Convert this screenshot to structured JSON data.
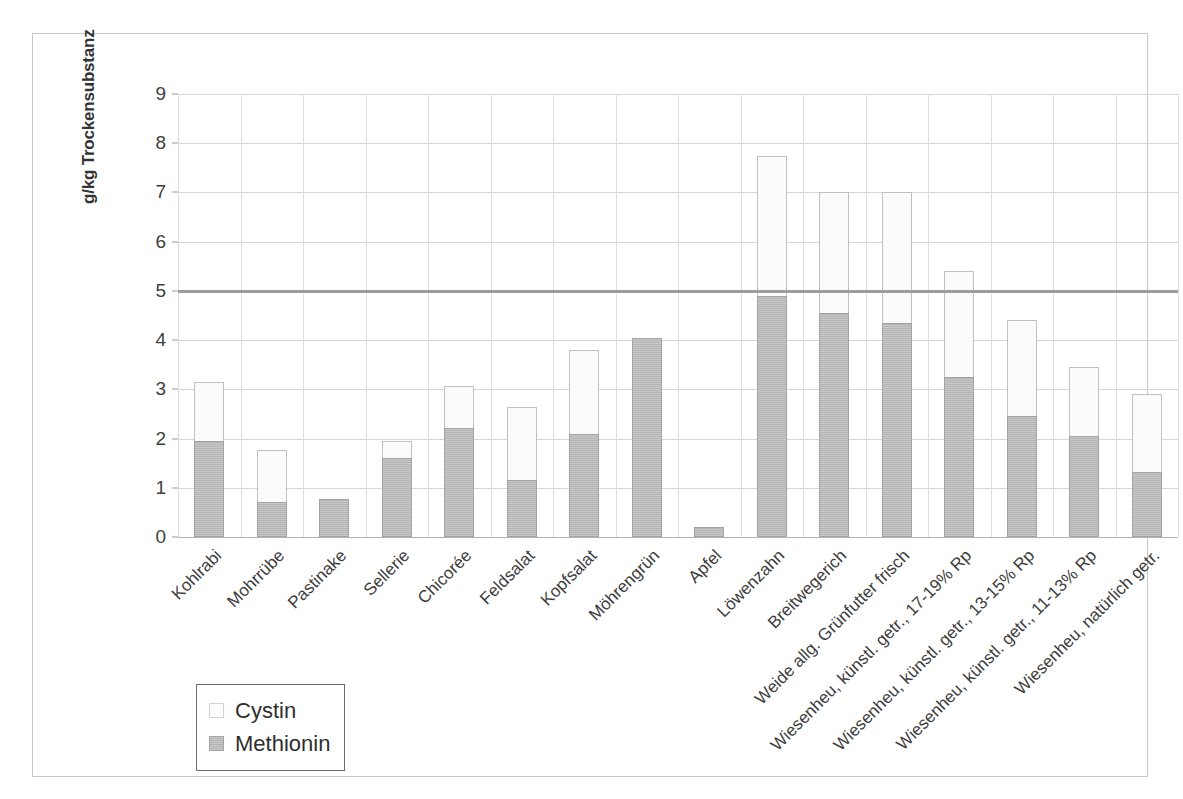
{
  "chart_data": {
    "type": "bar",
    "subtype": "stacked-bar",
    "title": "",
    "xlabel": "",
    "ylabel": "g/kg Trockensubstanz",
    "ylim": [
      0,
      9
    ],
    "ytick_labels": [
      "0",
      "1",
      "2",
      "3",
      "4",
      "5",
      "6",
      "7",
      "8",
      "9"
    ],
    "ytick_values": [
      0,
      1,
      2,
      3,
      4,
      5,
      6,
      7,
      8,
      9
    ],
    "grid": true,
    "legend_position": "bottom-left",
    "categories": [
      "Kohlrabi",
      "Mohrrübe",
      "Pastinake",
      "Sellerie",
      "Chicorée",
      "Feldsalat",
      "Kopfsalat",
      "Möhrengrün",
      "Apfel",
      "Löwenzahn",
      "Breitwegerich",
      "Weide allg. Grünfutter frisch",
      "Wiesenheu, künstl. getr., 17-19% Rp",
      "Wiesenheu, künstl. getr., 13-15% Rp",
      "Wiesenheu, künstl. getr., 11-13% Rp",
      "Wiesenheu, natürlich getr."
    ],
    "series": [
      {
        "name": "Methionin",
        "color": "#b8b8b8",
        "values": [
          1.95,
          0.72,
          0.78,
          1.6,
          2.22,
          1.15,
          2.1,
          4.05,
          0.2,
          4.9,
          4.55,
          4.35,
          3.25,
          2.45,
          2.05,
          1.32
        ]
      },
      {
        "name": "Cystin",
        "color": "#fbfbfb",
        "values": [
          1.2,
          1.05,
          0.0,
          0.35,
          0.85,
          1.5,
          1.7,
          0.0,
          0.0,
          2.85,
          2.45,
          2.65,
          2.15,
          1.95,
          1.4,
          1.58
        ]
      }
    ],
    "totals": [
      3.15,
      1.77,
      0.78,
      1.95,
      3.07,
      2.65,
      3.8,
      4.05,
      0.2,
      7.75,
      7.0,
      7.0,
      5.4,
      4.4,
      3.45,
      2.9
    ],
    "reference_line": {
      "value": 5,
      "color": "#9d9d9d",
      "label": ""
    }
  },
  "legend": {
    "items": [
      {
        "label": "Cystin",
        "swatch": "cystin"
      },
      {
        "label": "Methionin",
        "swatch": "methionin"
      }
    ]
  }
}
